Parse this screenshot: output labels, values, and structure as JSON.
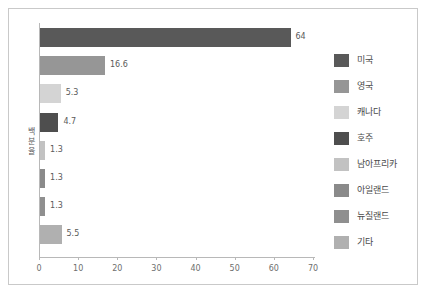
{
  "chart_data": {
    "type": "bar",
    "orientation": "horizontal",
    "title": "",
    "xlabel": "",
    "ylabel": "백분율",
    "xlim": [
      0,
      70
    ],
    "xticks": [
      0,
      10,
      20,
      30,
      40,
      50,
      60,
      70
    ],
    "grid": false,
    "legend_position": "right",
    "categories": [
      "미국",
      "영국",
      "캐나다",
      "호주",
      "남아프리카",
      "아일랜드",
      "뉴질랜드",
      "기타"
    ],
    "values": [
      64,
      16.6,
      5.3,
      4.7,
      1.3,
      1.3,
      1.3,
      5.5
    ],
    "value_labels": [
      "64",
      "16.6",
      "5.3",
      "4.7",
      "1.3",
      "1.3",
      "1.3",
      "5.5"
    ],
    "colors": [
      "#595959",
      "#969696",
      "#d4d4d4",
      "#4e4e4e",
      "#c2c2c2",
      "#8a8a8a",
      "#8f8f8f",
      "#b0b0b0"
    ],
    "series": [
      {
        "name": "백분율",
        "values": [
          64,
          16.6,
          5.3,
          4.7,
          1.3,
          1.3,
          1.3,
          5.5
        ]
      }
    ]
  },
  "axis": {
    "x_tick_labels": [
      "0",
      "10",
      "20",
      "30",
      "40",
      "50",
      "60",
      "70"
    ],
    "y_title": "백분율"
  },
  "legend": {
    "items": [
      {
        "label": "미국",
        "color": "#595959"
      },
      {
        "label": "영국",
        "color": "#969696"
      },
      {
        "label": "캐나다",
        "color": "#d4d4d4"
      },
      {
        "label": "호주",
        "color": "#4e4e4e"
      },
      {
        "label": "남아프리카",
        "color": "#c2c2c2"
      },
      {
        "label": "아일랜드",
        "color": "#8a8a8a"
      },
      {
        "label": "뉴질랜드",
        "color": "#8f8f8f"
      },
      {
        "label": "기타",
        "color": "#b0b0b0"
      }
    ]
  },
  "style": {
    "frame_border": "#c9c9c9",
    "axis_color": "#b8b8b8",
    "label_color": "#5a5a5a",
    "background": "#ffffff"
  }
}
